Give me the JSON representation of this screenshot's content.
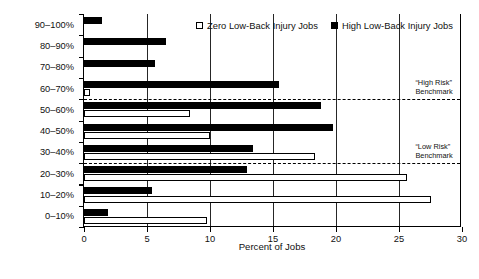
{
  "chart_data": {
    "type": "bar",
    "orientation": "horizontal",
    "title": "",
    "xlabel": "Percent of Jobs",
    "ylabel": "LBD Risk Value Category",
    "xlim": [
      0,
      30
    ],
    "ylim_categories": 10,
    "grid": "vertical gridlines at each x tick",
    "legend_position": "top-center-inside",
    "xticks": [
      0,
      5,
      10,
      15,
      20,
      25,
      30
    ],
    "xticklabels": [
      "0",
      "5",
      "10",
      "15",
      "20",
      "25",
      "30"
    ],
    "categories": [
      "0–10%",
      "10–20%",
      "20–30%",
      "30–40%",
      "40–50%",
      "50–60%",
      "60–70%",
      "70–80%",
      "80–90%",
      "90–100%"
    ],
    "series": [
      {
        "name": "Zero Low-Back Injury Jobs",
        "style": "white-fill-black-outline",
        "color": "#ffffff",
        "values": [
          9.8,
          27.5,
          25.6,
          18.3,
          10.0,
          8.4,
          0.5,
          0.0,
          0.0,
          0.0
        ]
      },
      {
        "name": "High Low-Back Injury Jobs",
        "style": "black-fill",
        "color": "#000000",
        "values": [
          1.9,
          5.4,
          12.9,
          13.4,
          19.8,
          18.8,
          15.5,
          5.6,
          6.5,
          1.4
        ]
      }
    ],
    "annotations": [
      {
        "name": "high-risk-benchmark",
        "label": "“High Risk”\nBenchmark",
        "line_style": "dashed",
        "between_categories": [
          "50–60%",
          "60–70%"
        ]
      },
      {
        "name": "low-risk-benchmark",
        "label": "“Low Risk”\nBenchmark",
        "line_style": "dashed",
        "between_categories": [
          "20–30%",
          "30–40%"
        ]
      }
    ]
  },
  "legend": {
    "items": [
      {
        "label": "Zero Low-Back Injury Jobs",
        "swatch": "open-square-marker"
      },
      {
        "label": "High Low-Back Injury Jobs",
        "swatch": "filled-square-marker"
      }
    ]
  },
  "axes": {
    "x_title": "Percent of Jobs",
    "y_title": "LBD Risk Value Category"
  }
}
